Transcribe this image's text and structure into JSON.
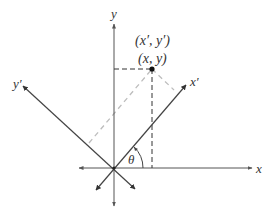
{
  "diagram": {
    "labels": {
      "y_axis": "y",
      "x_axis": "x",
      "x_prime_axis": "x′",
      "y_prime_axis": "y′",
      "point_rotated": "(x′, y′)",
      "point_original": "(x, y)",
      "angle": "θ"
    },
    "colors": {
      "axes": "#555555",
      "rotated_axes": "#444444",
      "dashed_black": "#333333",
      "dashed_gray": "#bbbbbb",
      "point": "#111111"
    },
    "geometry": {
      "origin": [
        114,
        168
      ],
      "point": [
        152,
        69
      ],
      "rotation_angle_deg": 45
    }
  }
}
